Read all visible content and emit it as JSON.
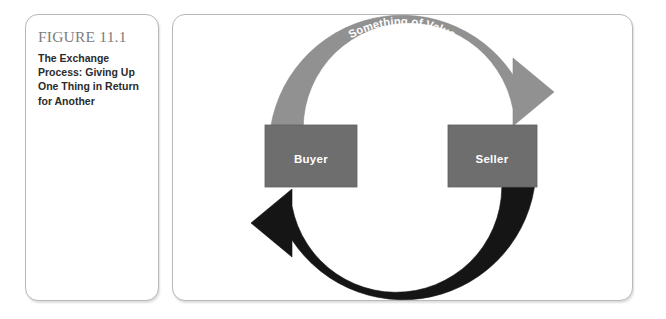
{
  "figure": {
    "number": "FIGURE 11.1",
    "caption": "The Exchange Process: Giving Up One Thing in Return for Another"
  },
  "diagram": {
    "type": "cycle",
    "nodes": [
      {
        "id": "buyer",
        "label": "Buyer",
        "color": "#6e6e6e"
      },
      {
        "id": "seller",
        "label": "Seller",
        "color": "#6e6e6e"
      }
    ],
    "flows": [
      {
        "id": "buyer-to-seller",
        "from": "buyer",
        "to": "seller",
        "position": "top",
        "color": "#919191",
        "label_line1": "Something of Value",
        "label_line2": "(money, credit, labor, goods)"
      },
      {
        "id": "seller-to-buyer",
        "from": "seller",
        "to": "buyer",
        "position": "bottom",
        "color": "#151515",
        "label_line1": "Something of Value",
        "label_line2": "(goods, services, ideas)"
      }
    ]
  },
  "colors": {
    "panel_border": "#b8b8b8",
    "figure_number": "#7d7d7d",
    "caption_text": "#2b2b2b",
    "node_fill": "#6e6e6e",
    "top_arrow": "#919191",
    "bottom_arrow": "#151515",
    "label_text": "#ffffff"
  }
}
